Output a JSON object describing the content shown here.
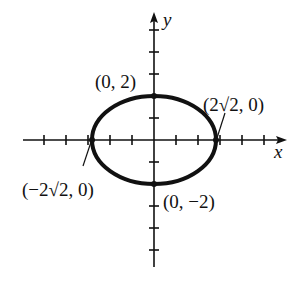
{
  "figure": {
    "type": "ellipse-graph",
    "equation_semi_axes": {
      "a": "2√2",
      "b": "2"
    },
    "axes": {
      "x_label": "x",
      "y_label": "y"
    },
    "points": [
      {
        "name": "top",
        "label": "(0, 2)"
      },
      {
        "name": "right",
        "label": "(2√2, 0)"
      },
      {
        "name": "left",
        "label": "(−2√2, 0)"
      },
      {
        "name": "bottom",
        "label": "(0, −2)"
      }
    ],
    "colors": {
      "ink": "#111111",
      "background": "#ffffff"
    }
  }
}
